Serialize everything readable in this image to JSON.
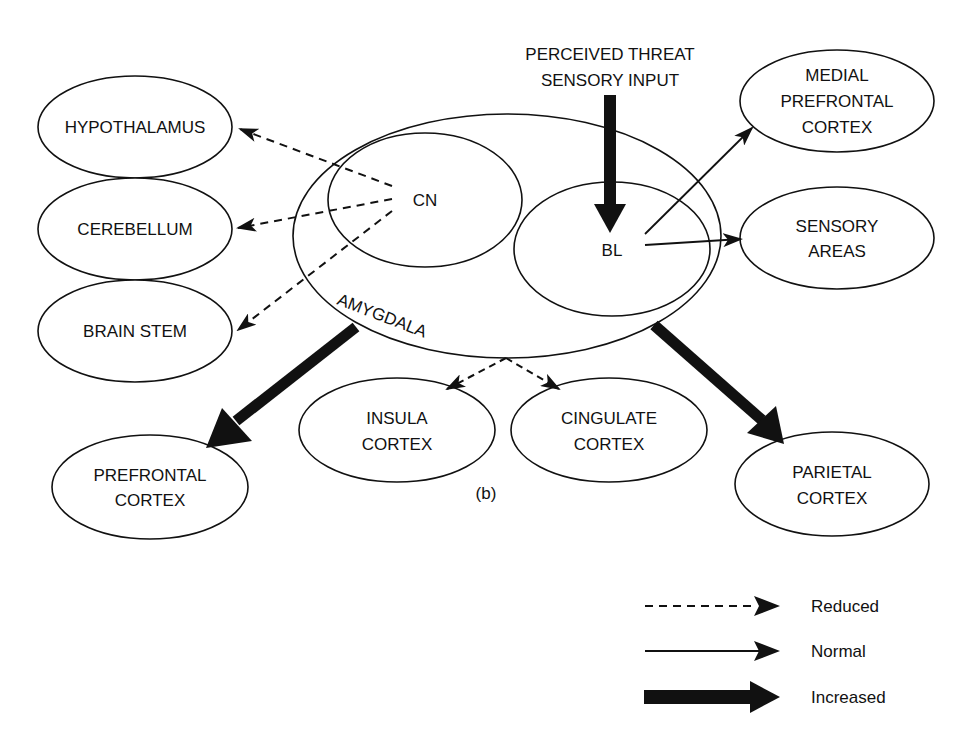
{
  "diagram": {
    "caption": "(b)",
    "input_label_line1": "PERCEIVED THREAT",
    "input_label_line2": "SENSORY INPUT",
    "amygdala": {
      "label": "AMYGDALA"
    },
    "nuclei": {
      "cn": "CN",
      "bl": "BL"
    },
    "nodes": {
      "hypothalamus": [
        "HYPOTHALAMUS"
      ],
      "cerebellum": [
        "CEREBELLUM"
      ],
      "brain_stem": [
        "BRAIN STEM"
      ],
      "medial_pfc": [
        "MEDIAL",
        "PREFRONTAL",
        "CORTEX"
      ],
      "sensory_areas": [
        "SENSORY",
        "AREAS"
      ],
      "prefrontal": [
        "PREFRONTAL",
        "CORTEX"
      ],
      "insula": [
        "INSULA",
        "CORTEX"
      ],
      "cingulate": [
        "CINGULATE",
        "CORTEX"
      ],
      "parietal": [
        "PARIETAL",
        "CORTEX"
      ]
    },
    "edges": [
      {
        "from": "CN",
        "to": "HYPOTHALAMUS",
        "type": "reduced"
      },
      {
        "from": "CN",
        "to": "CEREBELLUM",
        "type": "reduced"
      },
      {
        "from": "CN",
        "to": "BRAIN STEM",
        "type": "reduced"
      },
      {
        "from": "PERCEIVED THREAT SENSORY INPUT",
        "to": "BL",
        "type": "increased"
      },
      {
        "from": "BL",
        "to": "MEDIAL PREFRONTAL CORTEX",
        "type": "normal"
      },
      {
        "from": "BL",
        "to": "SENSORY AREAS",
        "type": "normal"
      },
      {
        "from": "AMYGDALA",
        "to": "PREFRONTAL CORTEX",
        "type": "increased"
      },
      {
        "from": "AMYGDALA",
        "to": "INSULA CORTEX",
        "type": "reduced"
      },
      {
        "from": "AMYGDALA",
        "to": "CINGULATE CORTEX",
        "type": "reduced"
      },
      {
        "from": "AMYGDALA",
        "to": "PARIETAL CORTEX",
        "type": "increased"
      }
    ]
  },
  "legend": {
    "reduced": "Reduced",
    "normal": "Normal",
    "increased": "Increased"
  },
  "colors": {
    "line": "#111111",
    "background": "#ffffff"
  }
}
